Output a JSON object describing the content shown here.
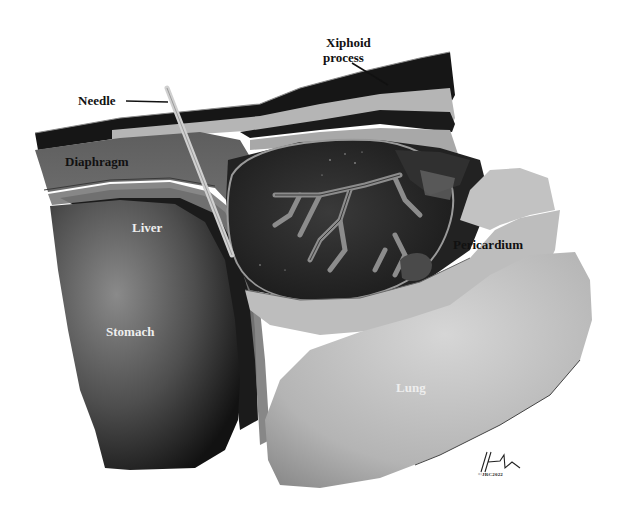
{
  "figure": {
    "style": "grayscale",
    "labels": {
      "needle": "Needle",
      "xiphoid_line1": "Xiphoid",
      "xiphoid_line2": "process",
      "diaphragm": "Diaphragm",
      "liver": "Liver",
      "stomach": "Stomach",
      "pericardium": "Pericardium",
      "lung": "Lung"
    },
    "signature": {
      "copyright": "©JRC2022"
    },
    "colors": {
      "background": "#ffffff",
      "skin_dark": "#1a1a1a",
      "tissue_light": "#b9b9b9",
      "diaphragm": "#6e6e6e",
      "liver": "#1e1e1e",
      "stomach": "#5a5a5a",
      "heart_dark": "#2a2a2a",
      "heart_vessel": "#8a8a8a",
      "pericardium": "#bdbdbd",
      "lung": "#c4c4c4",
      "needle": "#c8c8c8"
    }
  }
}
